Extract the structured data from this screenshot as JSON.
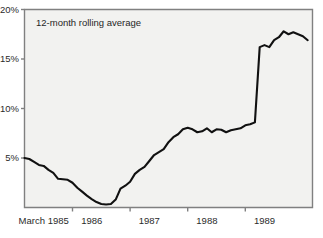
{
  "chart_data": {
    "type": "line",
    "title": "",
    "subtitle": "",
    "xlabel": "",
    "ylabel": "",
    "annotation": "12-month rolling average",
    "grid": false,
    "legend": "none",
    "plot_background": "#f2f2f0",
    "line_color": "#111111",
    "axis_color": "#808080",
    "text_color": "#2b2b2b",
    "ylim": [
      0,
      20
    ],
    "ytick_values": [
      5,
      10,
      15,
      20
    ],
    "ytick_labels": [
      "5%",
      "10%",
      "15%",
      "20%"
    ],
    "xlim": [
      0,
      60
    ],
    "xtick_values": [
      10,
      22,
      34,
      46
    ],
    "xtick_labels_positions": [
      4,
      14,
      26,
      38,
      50
    ],
    "xtick_labels": [
      "March 1985",
      "1986",
      "1987",
      "1988",
      "1989"
    ],
    "x_unit": "months since January 1985",
    "series": [
      {
        "name": "12-month rolling average",
        "x": [
          0,
          1,
          2,
          3,
          4,
          5,
          6,
          7,
          8,
          9,
          10,
          11,
          12,
          13,
          14,
          15,
          16,
          17,
          18,
          19,
          20,
          21,
          22,
          23,
          24,
          25,
          26,
          27,
          28,
          29,
          30,
          31,
          32,
          33,
          34,
          35,
          36,
          37,
          38,
          39,
          40,
          41,
          42,
          43,
          44,
          45,
          46,
          47,
          48,
          49,
          50,
          51,
          52,
          53,
          54,
          55,
          56,
          57,
          58,
          59
        ],
        "values": [
          5.0,
          4.9,
          4.6,
          4.3,
          4.2,
          3.8,
          3.5,
          2.9,
          2.85,
          2.8,
          2.5,
          2.0,
          1.6,
          1.2,
          0.85,
          0.55,
          0.35,
          0.3,
          0.35,
          0.8,
          1.9,
          2.2,
          2.6,
          3.4,
          3.8,
          4.1,
          4.7,
          5.3,
          5.6,
          5.9,
          6.6,
          7.1,
          7.4,
          7.9,
          8.05,
          7.9,
          7.6,
          7.7,
          8.0,
          7.6,
          7.9,
          7.85,
          7.6,
          7.8,
          7.9,
          8.0,
          8.3,
          8.4,
          8.6,
          16.2,
          16.4,
          16.2,
          16.9,
          17.2,
          17.8,
          17.5,
          17.7,
          17.5,
          17.3,
          16.9
        ],
        "min_value": 0.3,
        "max_value": 17.8,
        "start_value": 5.0,
        "end_value": 16.9
      }
    ]
  }
}
